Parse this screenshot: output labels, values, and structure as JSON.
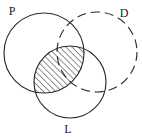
{
  "figure": {
    "type": "venn-diagram",
    "width": 142,
    "height": 137,
    "background_color": "#ffffff",
    "stroke_color": "#2b2b2b",
    "label_color": "#1a1a1a"
  },
  "labels": {
    "set_p": "P",
    "set_d": "D",
    "set_l": "L"
  },
  "label_positions": {
    "set_p": {
      "x": 12,
      "y": 15
    },
    "set_d": {
      "x": 124,
      "y": 17
    },
    "set_l": {
      "x": 68,
      "y": 133
    }
  },
  "circles": [
    {
      "id": "circle-p",
      "label": "P",
      "cx": 44,
      "cy": 53,
      "r": 40,
      "stroke_style": "solid"
    },
    {
      "id": "circle-d",
      "label": "D",
      "cx": 97,
      "cy": 52,
      "r": 40,
      "stroke_style": "dashed"
    },
    {
      "id": "circle-l",
      "label": "L",
      "cx": 70,
      "cy": 82,
      "r": 36,
      "stroke_style": "solid"
    }
  ],
  "shaded_region": {
    "id": "region-p-intersect-l",
    "description": "P intersect L",
    "fill_pattern": "diagonal-hatch",
    "hatch_angle_degrees": 45,
    "hatch_spacing_px": 3,
    "hatch_color": "#2b2b2b"
  }
}
